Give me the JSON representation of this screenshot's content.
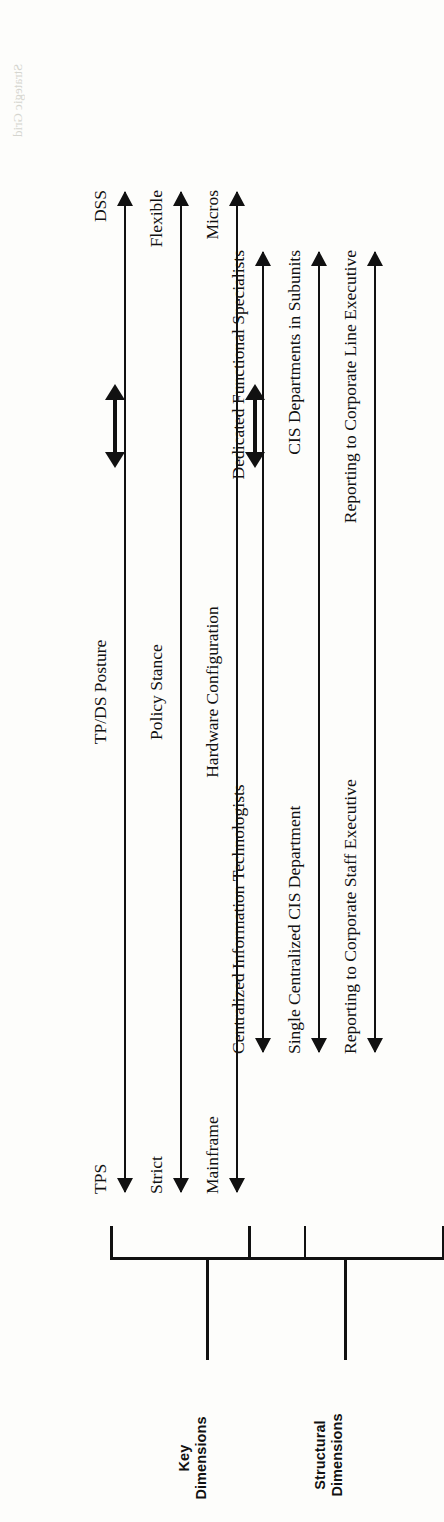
{
  "figure": {
    "type": "diagram",
    "orientation": "rotated-90-ccw",
    "groups": [
      {
        "id": "key-dimensions",
        "label": "Key\nDimensions",
        "rows": [
          {
            "left_pole": "TPS",
            "dimension": "TP/DS Posture",
            "right_pole": "DSS"
          },
          {
            "left_pole": "Strict",
            "dimension": "Policy Stance",
            "right_pole": "Flexible"
          },
          {
            "left_pole": "Mainframe",
            "dimension": "Hardware Configuration",
            "right_pole": "Micros"
          }
        ],
        "connector": "double-headed-arrow"
      },
      {
        "id": "structural-dimensions",
        "label": "Structural\nDimensions",
        "rows": [
          {
            "left_pole": "Centralized Information Technologists",
            "dimension": "",
            "right_pole": "Dedicated Functional Specialists"
          },
          {
            "left_pole": "Single Centralized CIS Department",
            "dimension": "",
            "right_pole": "CIS Departments in Subunits"
          },
          {
            "left_pole": "Reporting to Corporate Staff Executive",
            "dimension": "",
            "right_pole": "Reporting to Corporate Line Executive"
          }
        ],
        "connector": "double-headed-arrow"
      }
    ]
  },
  "colors": {
    "ink": "#111111",
    "paper": "#fdfdfb",
    "ghost": "#cfcfc8"
  },
  "ghost_text": {
    "top": "Strategic Grid"
  }
}
